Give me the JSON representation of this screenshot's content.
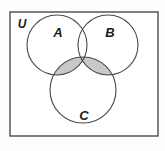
{
  "figure": {
    "type": "venn-3-set",
    "background_color": "#fdfdfc",
    "width": 165,
    "height": 151
  },
  "universe": {
    "label": "U",
    "label_x": 22,
    "label_y": 28,
    "rect": {
      "x": 10,
      "y": 12,
      "width": 148,
      "height": 124
    },
    "fill_color": "#ffffff",
    "stroke_color": "#4a4a4a"
  },
  "sets": [
    {
      "name": "A",
      "label": "A",
      "cx": 57,
      "cy": 45,
      "r": 30,
      "label_x": 58,
      "label_y": 37
    },
    {
      "name": "B",
      "label": "B",
      "cx": 108,
      "cy": 45,
      "r": 30,
      "label_x": 110,
      "label_y": 37
    },
    {
      "name": "C",
      "label": "C",
      "cx": 83,
      "cy": 90,
      "r": 33,
      "label_x": 84,
      "label_y": 120
    }
  ],
  "shading": {
    "description": "C intersect (A union B)",
    "expression": "C ∩ (A ∪ B)",
    "fill_color": "#c9c9c9",
    "regions": [
      "A∩C",
      "B∩C",
      "A∩B∩C"
    ]
  },
  "stroke": {
    "circle_color": "#4a4a4a",
    "circle_width": 1.1,
    "rect_width": 1.4
  }
}
